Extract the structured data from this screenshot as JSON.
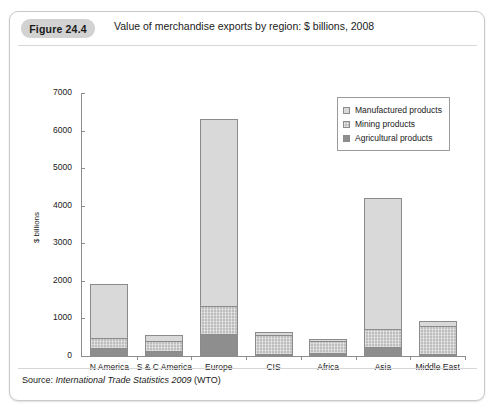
{
  "figure": {
    "badge": "Figure 24.4",
    "title": "Value of merchandise exports by region: $ billions, 2008",
    "source_prefix": "Source:",
    "source_italic": "International Trade Statistics 2009",
    "source_suffix": "(WTO)"
  },
  "chart_data": {
    "type": "bar",
    "stacked": true,
    "title": "Value of merchandise exports by region: $ billions, 2008",
    "xlabel": "",
    "ylabel": "$ billions",
    "ylim": [
      0,
      7000
    ],
    "yticks": [
      0,
      1000,
      2000,
      3000,
      4000,
      5000,
      6000,
      7000
    ],
    "ytick_labels": [
      "0",
      "1000",
      "2000",
      "3000",
      "4000",
      "5000",
      "6000",
      "7000"
    ],
    "grid": false,
    "legend_position": "top-right",
    "categories": [
      "N America",
      "S & C America",
      "Europe",
      "CIS",
      "Africa",
      "Asia",
      "Middle East"
    ],
    "series": [
      {
        "name": "Agricultural products",
        "color": "#8e8e8e",
        "values": [
          210,
          140,
          590,
          40,
          70,
          250,
          30
        ]
      },
      {
        "name": "Mining products",
        "color": "#bdbdbd",
        "values": [
          280,
          250,
          730,
          500,
          330,
          460,
          740
        ]
      },
      {
        "name": "Manufactured products",
        "color": "#d9d9d9",
        "values": [
          1440,
          160,
          4980,
          80,
          50,
          3490,
          130
        ]
      }
    ],
    "totals": [
      1930,
      550,
      6300,
      620,
      450,
      4200,
      900
    ],
    "legend": [
      "Manufactured products",
      "Mining products",
      "Agricultural products"
    ]
  }
}
